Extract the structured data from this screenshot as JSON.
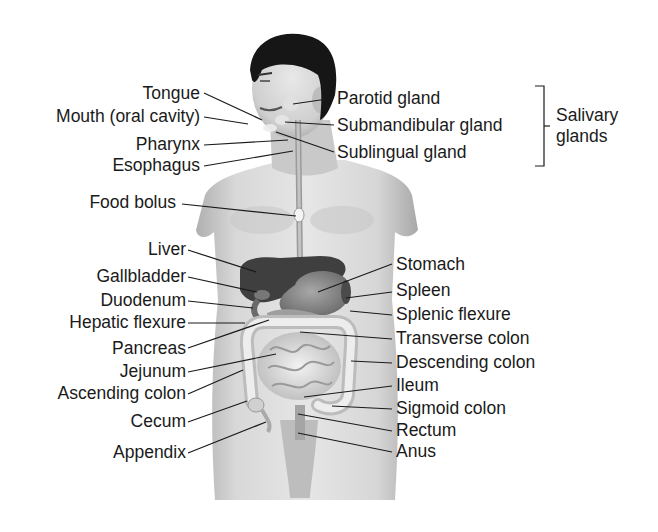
{
  "diagram": {
    "left_labels": [
      {
        "id": "tongue",
        "text": "Tongue",
        "x": 200,
        "y": 84
      },
      {
        "id": "mouth",
        "text": "Mouth (oral cavity)",
        "x": 200,
        "y": 105
      },
      {
        "id": "pharynx",
        "text": "Pharynx",
        "x": 200,
        "y": 133
      },
      {
        "id": "esophagus",
        "text": "Esophagus",
        "x": 200,
        "y": 154
      },
      {
        "id": "food-bolus",
        "text": "Food bolus",
        "x": 175,
        "y": 191
      },
      {
        "id": "liver",
        "text": "Liver",
        "x": 184,
        "y": 238
      },
      {
        "id": "gallbladder",
        "text": "Gallbladder",
        "x": 184,
        "y": 265
      },
      {
        "id": "duodenum",
        "text": "Duodenum",
        "x": 184,
        "y": 290
      },
      {
        "id": "hepatic-flexure",
        "text": "Hepatic flexure",
        "x": 184,
        "y": 312
      },
      {
        "id": "pancreas",
        "text": "Pancreas",
        "x": 184,
        "y": 338
      },
      {
        "id": "jejunum",
        "text": "Jejunum",
        "x": 184,
        "y": 360
      },
      {
        "id": "ascending-colon",
        "text": "Ascending colon",
        "x": 184,
        "y": 381
      },
      {
        "id": "cecum",
        "text": "Cecum",
        "x": 184,
        "y": 409
      },
      {
        "id": "appendix",
        "text": "Appendix",
        "x": 184,
        "y": 442
      }
    ],
    "right_labels": [
      {
        "id": "parotid-gland",
        "text": "Parotid gland",
        "x": 337,
        "y": 89
      },
      {
        "id": "submandibular-gland",
        "text": "Submandibular gland",
        "x": 337,
        "y": 116
      },
      {
        "id": "sublingual-gland",
        "text": "Sublingual gland",
        "x": 337,
        "y": 143
      },
      {
        "id": "stomach",
        "text": "Stomach",
        "x": 396,
        "y": 255
      },
      {
        "id": "spleen",
        "text": "Spleen",
        "x": 396,
        "y": 280
      },
      {
        "id": "splenic-flexure",
        "text": "Splenic flexure",
        "x": 396,
        "y": 304
      },
      {
        "id": "transverse-colon",
        "text": "Transverse colon",
        "x": 396,
        "y": 329
      },
      {
        "id": "descending-colon",
        "text": "Descending colon",
        "x": 396,
        "y": 353
      },
      {
        "id": "ileum",
        "text": "Ileum",
        "x": 396,
        "y": 376
      },
      {
        "id": "sigmoid-colon",
        "text": "Sigmoid colon",
        "x": 396,
        "y": 399
      },
      {
        "id": "rectum",
        "text": "Rectum",
        "x": 396,
        "y": 421
      },
      {
        "id": "anus",
        "text": "Anus",
        "x": 396,
        "y": 442
      }
    ],
    "group_label": {
      "line1": "Salivary",
      "line2": "glands",
      "x": 556,
      "y": 108
    },
    "colors": {
      "line": "#1a1a1a",
      "skin": "#d9d9d9",
      "skin_shadow": "#a9a9a9",
      "hair": "#141414",
      "organ_dark": "#4a4a4a",
      "organ_mid": "#8c8c8c",
      "intestine": "#e6e6e6",
      "text": "#1a1a1a"
    }
  }
}
